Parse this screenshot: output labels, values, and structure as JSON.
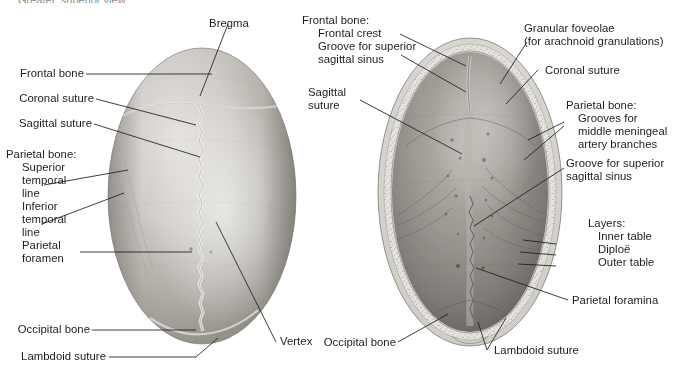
{
  "figure": {
    "title_clipped": "Greater, superior view",
    "background_color": "#ffffff",
    "text_color": "#1c1c1c",
    "leader_color": "#1d1d1d"
  },
  "left_panel": {
    "name": "skull-superior-view",
    "description": "Superior (vertex) view of the cranium, photographic grayscale",
    "bone_light": "#d8d6d2",
    "bone_mid": "#b4b1ab",
    "bone_dark": "#8e8b85",
    "suture_color": "#efeeea",
    "labels": [
      {
        "id": "bregma",
        "text": "Bregma"
      },
      {
        "id": "frontal-bone",
        "text": "Frontal bone"
      },
      {
        "id": "coronal-suture",
        "text": "Coronal suture"
      },
      {
        "id": "sagittal-suture",
        "text": "Sagittal suture"
      },
      {
        "id": "parietal-bone-heading",
        "text": "Parietal bone:"
      },
      {
        "id": "superior-temporal-line",
        "text": "Superior\ntemporal\nline"
      },
      {
        "id": "inferior-temporal-line",
        "text": "Inferior\ntemporal\nline"
      },
      {
        "id": "parietal-foramen",
        "text": "Parietal\nforamen"
      },
      {
        "id": "occipital-bone",
        "text": "Occipital bone"
      },
      {
        "id": "lambdoid-suture",
        "text": "Lambdoid suture"
      },
      {
        "id": "vertex",
        "text": "Vertex"
      }
    ]
  },
  "right_panel": {
    "name": "calvaria-internal-view",
    "description": "Internal surface of the calvaria (skull cap), photographic grayscale",
    "bone_rim": "#e2e0db",
    "inner_light": "#a9a6a0",
    "inner_mid": "#8d8a84",
    "inner_dark": "#6e6b66",
    "labels": [
      {
        "id": "frontal-bone-heading",
        "text": "Frontal bone:"
      },
      {
        "id": "frontal-crest",
        "text": "Frontal crest"
      },
      {
        "id": "groove-superior-sagittal-sinus-top",
        "text": "Groove for superior\nsagittal sinus"
      },
      {
        "id": "sagittal-suture",
        "text": "Sagittal\nsuture"
      },
      {
        "id": "granular-foveolae",
        "text": "Granular foveolae\n(for arachnoid granulations)"
      },
      {
        "id": "coronal-suture",
        "text": "Coronal suture"
      },
      {
        "id": "parietal-bone-heading",
        "text": "Parietal bone:"
      },
      {
        "id": "grooves-middle-meningeal",
        "text": "Grooves for\nmiddle meningeal\nartery branches"
      },
      {
        "id": "groove-superior-sagittal-sinus-right",
        "text": "Groove for superior\nsagittal sinus"
      },
      {
        "id": "layers-heading",
        "text": "Layers:"
      },
      {
        "id": "inner-table",
        "text": "Inner table"
      },
      {
        "id": "diploe",
        "text": "Diploë"
      },
      {
        "id": "outer-table",
        "text": "Outer table"
      },
      {
        "id": "parietal-foramina",
        "text": "Parietal foramina"
      },
      {
        "id": "occipital-bone",
        "text": "Occipital bone"
      },
      {
        "id": "lambdoid-suture",
        "text": "Lambdoid suture"
      }
    ]
  }
}
